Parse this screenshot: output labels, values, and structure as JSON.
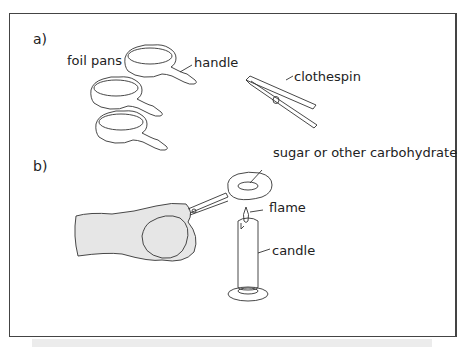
{
  "figure": {
    "panels": [
      {
        "id": "a",
        "label": "a)",
        "callouts": {
          "foil_pans": "foil pans",
          "handle": "handle",
          "clothespin": "clothespin"
        }
      },
      {
        "id": "b",
        "label": "b)",
        "callouts": {
          "sugar": "sugar or other carbohydrate",
          "flame": "flame",
          "candle": "candle"
        }
      }
    ],
    "colors": {
      "line": "#333333",
      "mitt_fill": "#e6e6e6",
      "frame": "#444444",
      "strip": "#ececec"
    }
  }
}
